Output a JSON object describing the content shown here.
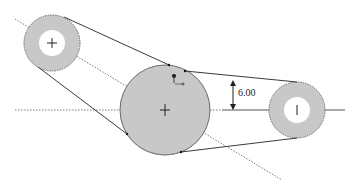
{
  "diagram": {
    "type": "belt-pulley sketch",
    "colors": {
      "background": "#ffffff",
      "pulley_fill": "#c8c8c8",
      "pulley_stroke": "#6a6a6a",
      "hole_fill": "#ffffff",
      "line": "#3a3a3a",
      "centerline": "#7a7a7a"
    },
    "pulleys": [
      {
        "id": "left-pulley",
        "cx": 52,
        "cy": 43,
        "r": 28,
        "hole_r": 13
      },
      {
        "id": "center-pulley",
        "cx": 165,
        "cy": 110,
        "r": 45,
        "hole_r": 0
      },
      {
        "id": "right-pulley",
        "cx": 297,
        "cy": 110,
        "r": 28,
        "hole_r": 13
      }
    ],
    "dimension": {
      "label": "6.00",
      "x": 234,
      "y1": 80,
      "y2": 110
    }
  }
}
